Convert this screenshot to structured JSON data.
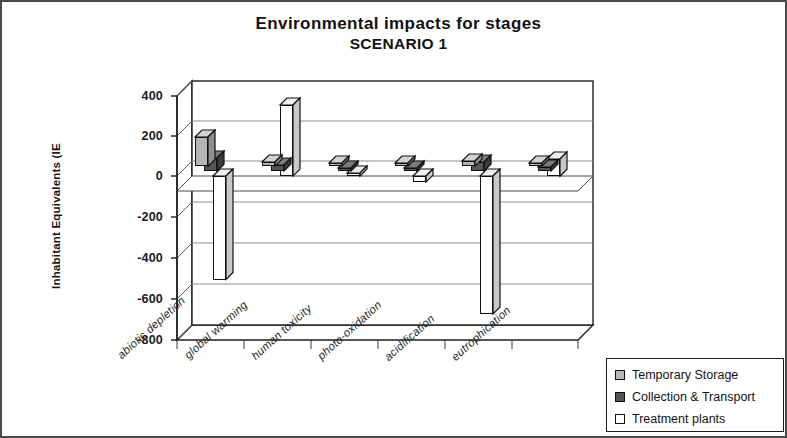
{
  "chart_title": "Environmental impacts for stages",
  "chart_subtitle": "SCENARIO 1",
  "y_axis_title": "Inhabitant Equivalents (IE",
  "y_ticks": [
    "400",
    "200",
    "0",
    "-200",
    "-400",
    "-600",
    "-800"
  ],
  "legend": {
    "items": [
      {
        "label": "Temporary Storage",
        "color": "#b5b5b5"
      },
      {
        "label": "Collection & Transport",
        "color": "#555555"
      },
      {
        "label": "Treatment plants",
        "color": "#ffffff"
      }
    ]
  },
  "chart_data": {
    "type": "bar",
    "title": "Environmental impacts for stages SCENARIO 1",
    "subtitle": "SCENARIO 1",
    "xlabel": "",
    "ylabel": "Inhabitant Equivalents (IE",
    "ylim": [
      -800,
      400
    ],
    "ytick_step": 200,
    "grid": true,
    "legend_position": "bottom-right",
    "style": "3D clustered column",
    "categories": [
      "abiotic depletion",
      "global warming",
      "human toxicity",
      "photo-oxidation",
      "acidification",
      "eutrophication"
    ],
    "series": [
      {
        "name": "Temporary Storage",
        "color": "#b5b5b5",
        "values": [
          145,
          20,
          10,
          8,
          25,
          12
        ]
      },
      {
        "name": "Collection & Transport",
        "color": "#555555",
        "values": [
          65,
          30,
          15,
          12,
          45,
          20
        ]
      },
      {
        "name": "Treatment plants",
        "color": "#ffffff",
        "values": [
          -510,
          350,
          10,
          -30,
          -680,
          85
        ]
      }
    ]
  }
}
